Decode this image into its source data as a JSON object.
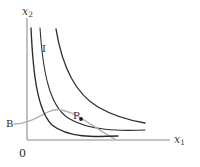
{
  "figure": {
    "kind": "indifference-curve-diagram",
    "background_color": "#ffffff"
  },
  "axes": {
    "y_label": "x",
    "y_subscript": "2",
    "x_label": "x",
    "x_subscript": "1",
    "origin_label": "0",
    "axis_color": "#8c8c8c",
    "x_axis": {
      "x_start": 27,
      "x_end": 170,
      "y": 140
    },
    "y_axis": {
      "x": 27,
      "y_start": 18,
      "y_end": 140
    }
  },
  "labels": {
    "indifference_curve": "I",
    "budget_curve": "B",
    "optimum_point": "P"
  },
  "colors": {
    "indifference_curve": "#2b2b2b",
    "budget_curve": "#b0b0b0",
    "point_marker": "#1a1a1a",
    "axis": "#8c8c8c",
    "text": "#2b2b2b"
  },
  "chart_data": {
    "type": "line",
    "title": "",
    "xlabel": "x1",
    "ylabel": "x2",
    "grid": false,
    "legend": "none",
    "axis_ranges": {
      "x": [
        0,
        170
      ],
      "y": [
        0,
        140
      ]
    },
    "series": [
      {
        "name": "Indifference curve (inner)",
        "color": "#2b2b2b",
        "style": "solid",
        "path": "M 31 28 C 33 72, 37 110, 52 125 C 68 138, 95 137, 118 136"
      },
      {
        "name": "Indifference curve (middle)",
        "color": "#2b2b2b",
        "style": "solid",
        "path": "M 40 28 C 43 74, 50 106, 68 118 C 89 131, 120 131, 145 130"
      },
      {
        "name": "Indifference curve I (outer)",
        "color": "#2b2b2b",
        "style": "solid",
        "path": "M 56 29 C 62 66, 76 94, 98 107 C 117 118, 133 121, 145 123"
      },
      {
        "name": "Budget constraint B",
        "color": "#b0b0b0",
        "style": "solid",
        "path": "M 14 124 C 26 124, 36 118, 48 112 C 68 102, 92 128, 115 139"
      }
    ],
    "points": [
      {
        "label": "P",
        "x": 81,
        "y": 119,
        "description": "tangency of budget curve with indifference curve"
      }
    ],
    "annotations": [
      {
        "text": "I",
        "x": 42,
        "y": 44
      },
      {
        "text": "B",
        "x": 6,
        "y": 119
      },
      {
        "text": "P",
        "x": 73,
        "y": 111
      },
      {
        "text": "0",
        "x": 19,
        "y": 148
      }
    ]
  }
}
